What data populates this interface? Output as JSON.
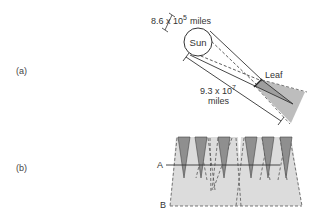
{
  "panel_a": {
    "label": "(a)",
    "sun_label": "Sun",
    "diameter_base": "8.6 x 10",
    "diameter_exp": "5",
    "diameter_unit": "miles",
    "distance_base": "9.3 x 10",
    "distance_exp": "7",
    "distance_unit": "miles",
    "leaf_label": "Leaf"
  },
  "panel_b": {
    "label": "(b)",
    "line_a_label": "A",
    "line_b_label": "B",
    "leaf_count": 6
  },
  "colors": {
    "line": "#333333",
    "umbra": "#9a9a9a",
    "penumbra": "#d9d9d9",
    "leaf": "#8f8f8f"
  }
}
